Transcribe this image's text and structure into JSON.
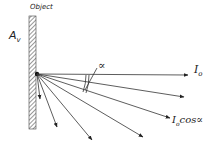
{
  "labels": {
    "object": "Object",
    "area_main": "A",
    "area_sub": "v",
    "angle": "∝",
    "intensity_main": "I",
    "intensity_sub": "o",
    "cos_main": "I",
    "cos_sub": "o",
    "cos_rest": "cos∝"
  },
  "geometry": {
    "origin": [
      37,
      74
    ],
    "rays": [
      {
        "end": [
          188,
          75
        ],
        "name": "ray-normal"
      },
      {
        "end": [
          184,
          97
        ],
        "name": "ray-2"
      },
      {
        "end": [
          170,
          118
        ],
        "name": "ray-alpha"
      },
      {
        "end": [
          143,
          137
        ],
        "name": "ray-4"
      },
      {
        "end": [
          92,
          140
        ],
        "name": "ray-5"
      },
      {
        "end": [
          57,
          127
        ],
        "name": "ray-6"
      },
      {
        "end": [
          40,
          99
        ],
        "name": "ray-7"
      }
    ]
  },
  "colors": {
    "ink": "#222222"
  }
}
